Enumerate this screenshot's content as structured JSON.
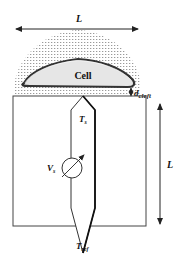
{
  "diagram": {
    "labels": {
      "top_width": "L",
      "cell": "Cell",
      "cleft": "d",
      "cleft_sub": "cleft",
      "right_height": "L",
      "sensor_tip": "T",
      "sensor_tip_sub": "s",
      "source": "V",
      "source_sub": "s",
      "reference_tip": "T",
      "reference_tip_sub": "ref"
    },
    "colors": {
      "stroke": "#222222",
      "cell_fill": "#e6e6e6",
      "stipple": "#9a9a9a",
      "background": "#ffffff"
    }
  }
}
